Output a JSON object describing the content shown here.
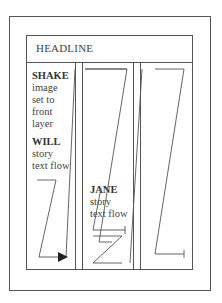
{
  "headline": "HEADLINE",
  "shake": {
    "name": "SHAKE",
    "lines": [
      "image",
      "set to",
      "front",
      "layer"
    ]
  },
  "will": {
    "name": "WILL",
    "lines": [
      "story",
      "text flow"
    ]
  },
  "jane": {
    "name": "JANE",
    "lines": [
      "story",
      "text flow"
    ]
  },
  "colors": {
    "line": "#555555",
    "text": "#333333"
  }
}
